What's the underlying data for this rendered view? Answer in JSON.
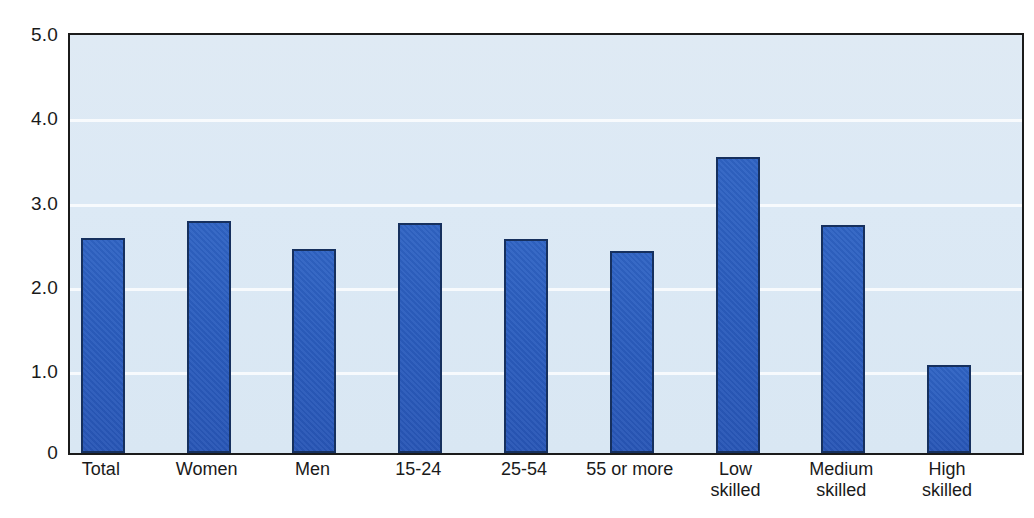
{
  "chart_data": {
    "type": "bar",
    "title": "",
    "subtitle": "",
    "xlabel": "",
    "ylabel": "",
    "categories": [
      "Total",
      "Women",
      "Men",
      "15-24",
      "25-54",
      "55 or more",
      "Low\nskilled",
      "Medium\nskilled",
      "High\nskilled"
    ],
    "values": [
      2.57,
      2.77,
      2.44,
      2.75,
      2.56,
      2.42,
      3.54,
      2.73,
      1.05
    ],
    "series": [
      {
        "name": "",
        "values": [
          2.57,
          2.77,
          2.44,
          2.75,
          2.56,
          2.42,
          3.54,
          2.73,
          1.05
        ]
      }
    ],
    "ylim": [
      0,
      5.0
    ],
    "y_ticks": [
      0,
      1.0,
      2.0,
      3.0,
      4.0,
      5.0
    ],
    "y_tick_labels": [
      "0",
      "1.0",
      "2.0",
      "3.0",
      "4.0",
      "5.0"
    ],
    "grid": true,
    "grid_axis": "y",
    "legend": false,
    "legend_position": "none",
    "annotations": []
  },
  "style": {
    "bar_color": "#2a5cbd",
    "bar_border_color": "#16305e",
    "plot_background": "#dce9f5",
    "gridline_color": "#ffffff",
    "axis_color": "#1b1b1b",
    "text_color": "#1a1a1a",
    "page_background": "#ffffff"
  }
}
